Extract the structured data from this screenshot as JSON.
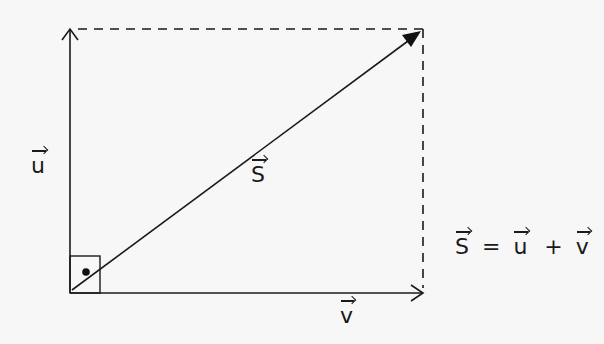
{
  "diagram": {
    "colors": {
      "stroke": "#1a1a1a",
      "background": "#f7f7f7"
    },
    "labels": {
      "u": "u",
      "v": "v",
      "s": "S"
    },
    "equation": {
      "lhs": "S",
      "equals": "=",
      "term1": "u",
      "plus": "+",
      "term2": "v"
    },
    "elements": [
      {
        "id": "vector-u",
        "type": "arrow",
        "from": [
          70,
          293
        ],
        "to": [
          70,
          29
        ],
        "style": "solid",
        "label": "u"
      },
      {
        "id": "vector-v",
        "type": "arrow",
        "from": [
          70,
          293
        ],
        "to": [
          423,
          293
        ],
        "style": "solid",
        "label": "v"
      },
      {
        "id": "vector-s",
        "type": "arrow",
        "from": [
          72,
          290
        ],
        "to": [
          421,
          31
        ],
        "style": "solid",
        "head": "filled",
        "label": "S"
      },
      {
        "id": "dashed-top",
        "type": "line",
        "from": [
          70,
          29
        ],
        "to": [
          423,
          29
        ],
        "style": "dashed"
      },
      {
        "id": "dashed-right",
        "type": "line",
        "from": [
          423,
          29
        ],
        "to": [
          423,
          293
        ],
        "style": "dashed"
      },
      {
        "id": "right-angle-marker",
        "type": "square",
        "x": 70,
        "y": 256,
        "size": 30,
        "dot": [
          86,
          273
        ]
      }
    ]
  }
}
